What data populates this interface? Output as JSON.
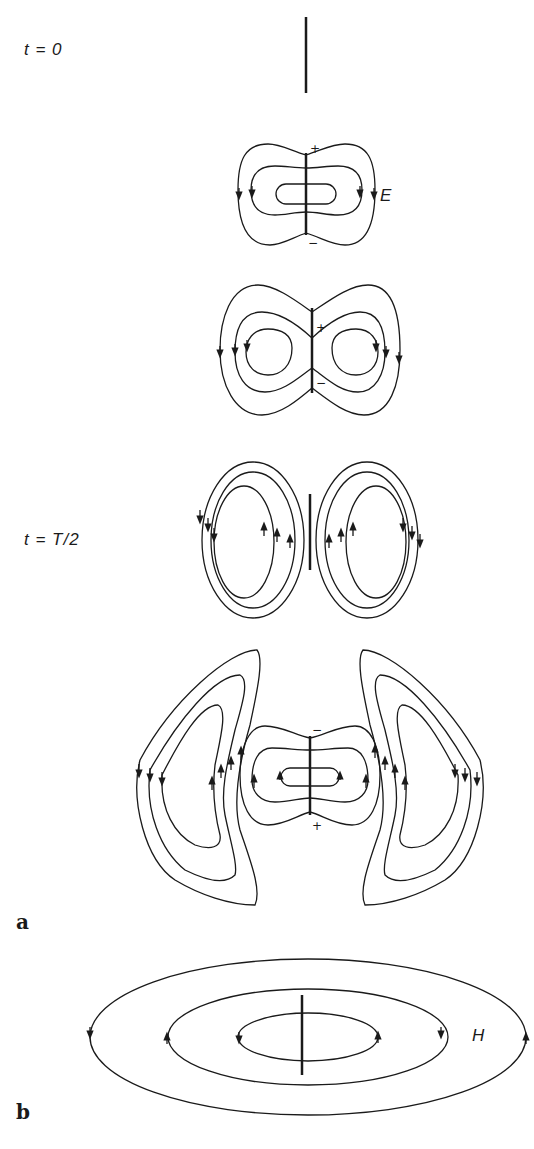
{
  "figure": {
    "panel_a": {
      "label": "a",
      "frames": [
        {
          "time_label": "t = 0",
          "description": "dipole at rest, no field lines"
        },
        {
          "charge_top": "+",
          "charge_bottom": "−",
          "field_label": "E"
        },
        {
          "charge_top": "+",
          "charge_bottom": "−"
        },
        {
          "time_label": "t = T/2",
          "description": "detached closed loops"
        },
        {
          "charge_top": "−",
          "charge_bottom": "+"
        }
      ]
    },
    "panel_b": {
      "label": "b",
      "field_label": "H"
    }
  }
}
